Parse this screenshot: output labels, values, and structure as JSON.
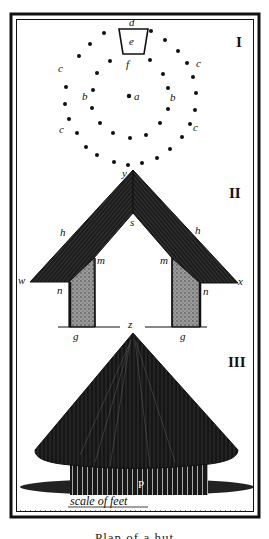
{
  "figure": {
    "section_numerals": [
      "I",
      "II",
      "III"
    ],
    "colors": {
      "ink": "#111111",
      "paper": "#ffffff",
      "wall_fill": "#8a8a8a",
      "roof_fill": "#1c1c1c"
    },
    "section_I": {
      "title": "I",
      "labels": {
        "d": "d",
        "e": "e",
        "f": "f",
        "a": "a",
        "b_left": "b",
        "b_right": "b",
        "c_top_right": "c",
        "c_left": "c",
        "c_bottom_right": "c",
        "c_top_left": "c"
      },
      "center_post": [
        129,
        96
      ],
      "outer_ring_posts": [
        [
          104,
          33
        ],
        [
          90,
          44
        ],
        [
          79,
          56
        ],
        [
          66,
          87
        ],
        [
          65,
          104
        ],
        [
          69,
          119
        ],
        [
          77,
          133
        ],
        [
          86,
          147
        ],
        [
          97,
          155
        ],
        [
          114,
          162
        ],
        [
          128,
          165
        ],
        [
          142,
          163
        ],
        [
          157,
          158
        ],
        [
          170,
          149
        ],
        [
          182,
          137
        ],
        [
          190,
          124
        ],
        [
          195,
          110
        ],
        [
          196,
          93
        ],
        [
          193,
          77
        ],
        [
          187,
          63
        ],
        [
          178,
          51
        ],
        [
          165,
          40
        ],
        [
          151,
          31
        ]
      ],
      "inner_ring_posts": [
        [
          110,
          61
        ],
        [
          97,
          73
        ],
        [
          93,
          90
        ],
        [
          92,
          108
        ],
        [
          100,
          123
        ],
        [
          113,
          133
        ],
        [
          130,
          138
        ],
        [
          146,
          135
        ],
        [
          160,
          123
        ],
        [
          168,
          109
        ],
        [
          168,
          88
        ],
        [
          163,
          74
        ],
        [
          150,
          60
        ]
      ]
    },
    "section_II": {
      "title": "II",
      "labels": {
        "y": "y",
        "s": "s",
        "h_left": "h",
        "h_right": "h",
        "m_left": "m",
        "m_right": "m",
        "w": "w",
        "x": "x",
        "n_left": "n",
        "n_right": "n",
        "z": "z",
        "g_left": "g",
        "g_right": "g"
      }
    },
    "section_III": {
      "title": "III",
      "labels": {
        "p": "P"
      }
    },
    "scale_label": "scale of feet",
    "caption": "Plan of a hut"
  }
}
